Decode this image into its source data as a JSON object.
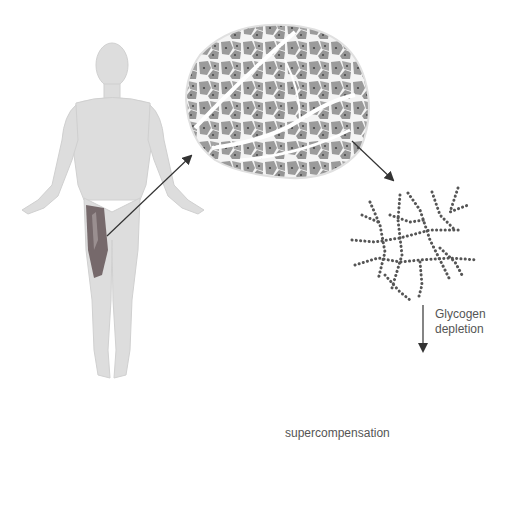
{
  "diagram": {
    "nodes": [
      {
        "id": "human-body",
        "description": "Human figure with highlighted thigh muscle (quadriceps)"
      },
      {
        "id": "muscle-cross-section",
        "description": "Muscle fiber cross-section"
      },
      {
        "id": "glycogen-normal",
        "description": "Glycogen molecule (normal)"
      },
      {
        "id": "glycogen-depleted",
        "description": "Glycogen molecule (depleted, smaller)"
      },
      {
        "id": "glycogen-supercompensated",
        "description": "Glycogen molecule (supercompensated, larger)"
      },
      {
        "id": "bicycle",
        "description": "Bicycle icon representing exercise"
      }
    ],
    "edges": [
      {
        "from": "human-body",
        "to": "muscle-cross-section",
        "label": ""
      },
      {
        "from": "muscle-cross-section",
        "to": "glycogen-normal",
        "label": ""
      },
      {
        "from": "glycogen-normal",
        "to": "glycogen-depleted",
        "label": "Glycogen depletion"
      },
      {
        "from": "glycogen-depleted",
        "to": "glycogen-supercompensated",
        "label": "supercompensation"
      }
    ],
    "labels": {
      "depletion_line1": "Glycogen",
      "depletion_line2": "depletion",
      "supercompensation": "supercompensation"
    },
    "colors": {
      "body": "#dcdcdc",
      "muscle_highlight": "#7a6e6e",
      "fiber": "#9a9a9a",
      "dots": "#555555",
      "arrow": "#333333",
      "bike": "#4a4a4a",
      "text": "#555555"
    }
  }
}
